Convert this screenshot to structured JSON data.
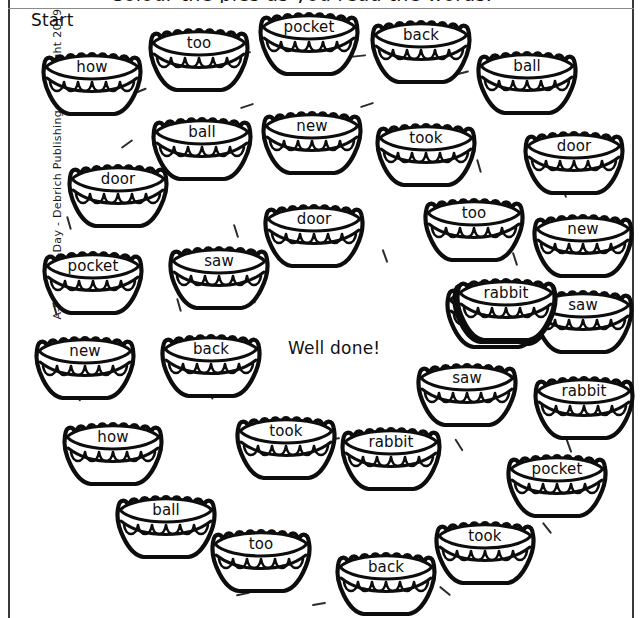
{
  "page": {
    "clipped_heading": "Colour the pies as you read the words.",
    "start_label": "Start",
    "well_done_label": "Well done!",
    "copyright": "A-Minute-A-Day - Debrich Publishing - Copyright 2019",
    "ink_color": "#111111",
    "background_color": "#ffffff"
  },
  "pies": [
    {
      "word": "how",
      "x": 36,
      "y": 44
    },
    {
      "word": "too",
      "x": 143,
      "y": 20
    },
    {
      "word": "pocket",
      "x": 253,
      "y": 4
    },
    {
      "word": "back",
      "x": 365,
      "y": 12
    },
    {
      "word": "ball",
      "x": 471,
      "y": 43
    },
    {
      "word": "ball",
      "x": 146,
      "y": 109
    },
    {
      "word": "new",
      "x": 256,
      "y": 103
    },
    {
      "word": "took",
      "x": 370,
      "y": 115
    },
    {
      "word": "door",
      "x": 518,
      "y": 123
    },
    {
      "word": "door",
      "x": 62,
      "y": 156
    },
    {
      "word": "door",
      "x": 258,
      "y": 196
    },
    {
      "word": "too",
      "x": 418,
      "y": 190
    },
    {
      "word": "new",
      "x": 527,
      "y": 206
    },
    {
      "word": "pocket",
      "x": 37,
      "y": 243
    },
    {
      "word": "saw",
      "x": 163,
      "y": 238
    },
    {
      "word": "rabbit",
      "x": 450,
      "y": 274
    },
    {
      "word": "saw",
      "x": 527,
      "y": 282
    },
    {
      "word": "rabbit",
      "x": 451,
      "y": 271
    },
    {
      "word": "how",
      "x": 440,
      "y": 277
    },
    {
      "word": "rabbit",
      "x": 447,
      "y": 272
    },
    {
      "word": "new",
      "x": 29,
      "y": 328
    },
    {
      "word": "back",
      "x": 155,
      "y": 326
    },
    {
      "word": "rabbit",
      "x": 450,
      "y": 270
    },
    {
      "word": "saw",
      "x": 411,
      "y": 355
    },
    {
      "word": "rabbit",
      "x": 528,
      "y": 368
    },
    {
      "word": "how",
      "x": 57,
      "y": 414
    },
    {
      "word": "took",
      "x": 230,
      "y": 408
    },
    {
      "word": "rabbit",
      "x": 335,
      "y": 419
    },
    {
      "word": "pocket",
      "x": 501,
      "y": 446
    },
    {
      "word": "ball",
      "x": 110,
      "y": 487
    },
    {
      "word": "too",
      "x": 205,
      "y": 521
    },
    {
      "word": "back",
      "x": 330,
      "y": 544
    },
    {
      "word": "took",
      "x": 429,
      "y": 513
    }
  ],
  "pies_extra": [
    {
      "word": "rabbit",
      "x": 452,
      "y": 273
    },
    {
      "word": "how",
      "x": 440,
      "y": 278
    },
    {
      "word": "saw",
      "x": 527,
      "y": 283
    }
  ],
  "dashes": [
    {
      "x": 133,
      "y": 90,
      "rot": -22
    },
    {
      "x": 237,
      "y": 52,
      "rot": -8
    },
    {
      "x": 352,
      "y": 55,
      "rot": -6
    },
    {
      "x": 455,
      "y": 72,
      "rot": -14
    },
    {
      "x": 523,
      "y": 103,
      "rot": 62
    },
    {
      "x": 360,
      "y": 104,
      "rot": -18
    },
    {
      "x": 240,
      "y": 105,
      "rot": -18
    },
    {
      "x": 120,
      "y": 143,
      "rot": -36
    },
    {
      "x": 472,
      "y": 165,
      "rot": 74
    },
    {
      "x": 557,
      "y": 190,
      "rot": 72
    },
    {
      "x": 62,
      "y": 222,
      "rot": 74
    },
    {
      "x": 229,
      "y": 230,
      "rot": 72
    },
    {
      "x": 378,
      "y": 255,
      "rot": 70
    },
    {
      "x": 508,
      "y": 258,
      "rot": 72
    },
    {
      "x": 567,
      "y": 262,
      "rot": 70
    },
    {
      "x": 48,
      "y": 308,
      "rot": 74
    },
    {
      "x": 172,
      "y": 304,
      "rot": 74
    },
    {
      "x": 245,
      "y": 296,
      "rot": 64
    },
    {
      "x": 505,
      "y": 338,
      "rot": 62
    },
    {
      "x": 570,
      "y": 340,
      "rot": 72
    },
    {
      "x": 70,
      "y": 394,
      "rot": 62
    },
    {
      "x": 203,
      "y": 392,
      "rot": 66
    },
    {
      "x": 326,
      "y": 438,
      "rot": -8
    },
    {
      "x": 452,
      "y": 444,
      "rot": 58
    },
    {
      "x": 562,
      "y": 445,
      "rot": 70
    },
    {
      "x": 107,
      "y": 466,
      "rot": 60
    },
    {
      "x": 194,
      "y": 510,
      "rot": 50
    },
    {
      "x": 236,
      "y": 593,
      "rot": -12
    },
    {
      "x": 312,
      "y": 603,
      "rot": -10
    },
    {
      "x": 438,
      "y": 590,
      "rot": 40
    },
    {
      "x": 540,
      "y": 527,
      "rot": 52
    }
  ]
}
